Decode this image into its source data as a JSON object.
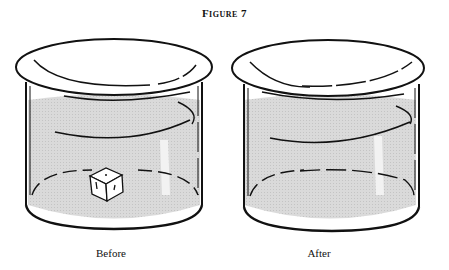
{
  "figure": {
    "title": "Figure 7",
    "panels": [
      {
        "label": "Before",
        "contents": "beaker with water and ice cube"
      },
      {
        "label": "After",
        "contents": "beaker with water, ice melted"
      }
    ]
  },
  "colors": {
    "line": "#111111",
    "water": "#d6d6d6",
    "background": "#ffffff"
  }
}
